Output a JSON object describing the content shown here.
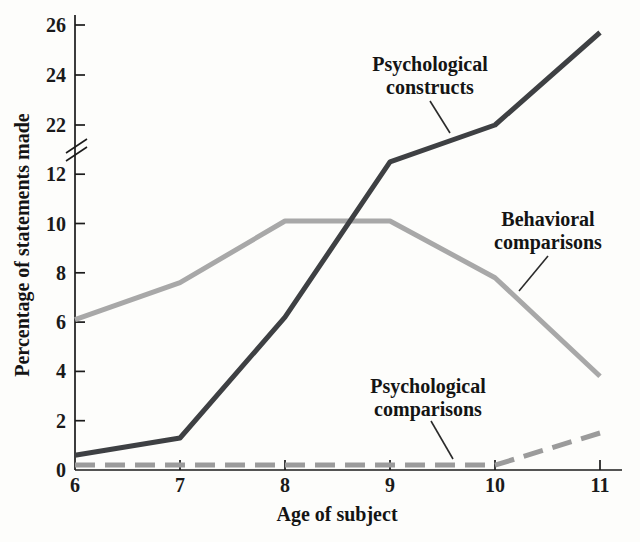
{
  "chart_data": {
    "type": "line",
    "title": "",
    "xlabel": "Age of subject",
    "ylabel": "Percentage of statements made",
    "x": [
      6,
      7,
      8,
      9,
      10,
      11
    ],
    "x_ticks": [
      6,
      7,
      8,
      9,
      10,
      11
    ],
    "y_ticks_lower": [
      0,
      2,
      4,
      6,
      8,
      10,
      12
    ],
    "y_ticks_upper": [
      22,
      24,
      26
    ],
    "axis_break_between": [
      12,
      22
    ],
    "ylim_lower_segment": [
      0,
      12.5
    ],
    "ylim_upper_segment": [
      22,
      26
    ],
    "grid": false,
    "legend_position": "inline-annotations",
    "axis_color": "#1b1b1b",
    "series": [
      {
        "name": "Psychological constructs",
        "color": "#3e4043",
        "style": "solid",
        "values": [
          0.6,
          1.3,
          6.2,
          12.5,
          22.0,
          25.7
        ]
      },
      {
        "name": "Behavioral comparisons",
        "color": "#a8a8a8",
        "style": "solid",
        "values": [
          6.1,
          7.6,
          10.1,
          10.1,
          7.8,
          3.8
        ]
      },
      {
        "name": "Psychological comparisons",
        "color": "#9b9b9b",
        "style": "dashed",
        "values": [
          0.2,
          0.2,
          0.2,
          0.2,
          0.2,
          1.5
        ]
      }
    ],
    "annotations": [
      {
        "line1": "Psychological",
        "line2": "constructs",
        "cx": 430,
        "top": 53,
        "leader": {
          "x1": 430,
          "y1": 101,
          "x2": 450,
          "y2": 133
        }
      },
      {
        "line1": "Behavioral",
        "line2": "comparisons",
        "cx": 548,
        "top": 208,
        "leader": {
          "x1": 548,
          "y1": 256,
          "x2": 519,
          "y2": 291
        }
      },
      {
        "line1": "Psychological",
        "line2": "comparisons",
        "cx": 428,
        "top": 375,
        "leader": {
          "x1": 431,
          "y1": 421,
          "x2": 453,
          "y2": 459
        }
      }
    ]
  }
}
